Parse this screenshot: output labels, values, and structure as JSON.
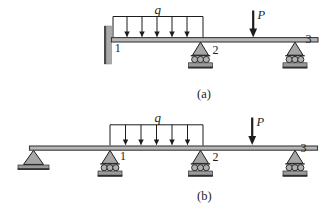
{
  "figure": {
    "a": {
      "caption": "(a)",
      "q_label": "q",
      "p_label": "P",
      "nodes": [
        "1",
        "2",
        "3"
      ]
    },
    "b": {
      "caption": "(b)",
      "q_label": "q",
      "p_label": "P",
      "nodes": [
        "1",
        "2",
        "3"
      ]
    },
    "colors": {
      "background": "#ffffff",
      "ink": "#1c1c1c",
      "beam_fill": "#b6b6b6",
      "beam_edge": "#3a3a3a",
      "support_fill": "#a6a6a6",
      "roller_fill": "#b0b0b0",
      "base_fill": "#9b9b9b",
      "base_edge": "#2e2e2e",
      "wall_fill": "#aaaaaa",
      "wall_edge": "#4a4a4a"
    }
  }
}
